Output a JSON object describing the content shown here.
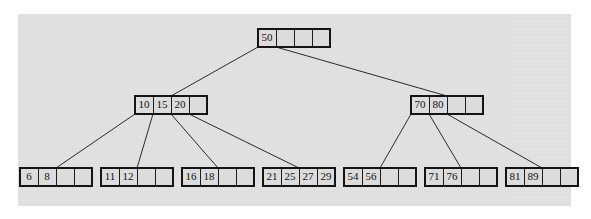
{
  "figure": {
    "background_color": "#ffffff",
    "panel_color": "#e3e3e3",
    "node_fill_color": "#dcdcdc",
    "node_border_color": "#1c1c1c",
    "edge_color": "#2a2a2a",
    "text_color": "#111111"
  },
  "ghost": {
    "top": "",
    "middle": "",
    "bottom": ""
  },
  "chart_data": {
    "type": "diagram",
    "diagram_kind": "b-tree",
    "node_capacity": 4,
    "levels": 3,
    "nodes": [
      {
        "id": "root",
        "level": 0,
        "keys": [
          "50"
        ],
        "empty_slots": 3,
        "x": 258,
        "y": 29,
        "cells": [
          "50",
          "",
          "",
          ""
        ]
      },
      {
        "id": "internal-left",
        "level": 1,
        "keys": [
          "10",
          "15",
          "20"
        ],
        "empty_slots": 1,
        "x": 135,
        "y": 96,
        "cells": [
          "10",
          "15",
          "20",
          ""
        ]
      },
      {
        "id": "internal-right",
        "level": 1,
        "keys": [
          "70",
          "80"
        ],
        "empty_slots": 2,
        "x": 411,
        "y": 96,
        "cells": [
          "70",
          "80",
          "",
          ""
        ]
      },
      {
        "id": "leaf-1",
        "level": 2,
        "keys": [
          "6",
          "8"
        ],
        "empty_slots": 2,
        "x": 20,
        "y": 168,
        "cells": [
          "6",
          "8",
          "",
          ""
        ]
      },
      {
        "id": "leaf-2",
        "level": 2,
        "keys": [
          "11",
          "12"
        ],
        "empty_slots": 2,
        "x": 101,
        "y": 168,
        "cells": [
          "11",
          "12",
          "",
          ""
        ]
      },
      {
        "id": "leaf-3",
        "level": 2,
        "keys": [
          "16",
          "18"
        ],
        "empty_slots": 2,
        "x": 182,
        "y": 168,
        "cells": [
          "16",
          "18",
          "",
          ""
        ]
      },
      {
        "id": "leaf-4",
        "level": 2,
        "keys": [
          "21",
          "25",
          "27",
          "29"
        ],
        "empty_slots": 0,
        "x": 263,
        "y": 168,
        "cells": [
          "21",
          "25",
          "27",
          "29"
        ]
      },
      {
        "id": "leaf-5",
        "level": 2,
        "keys": [
          "54",
          "56"
        ],
        "empty_slots": 2,
        "x": 344,
        "y": 168,
        "cells": [
          "54",
          "56",
          "",
          ""
        ]
      },
      {
        "id": "leaf-6",
        "level": 2,
        "keys": [
          "71",
          "76"
        ],
        "empty_slots": 2,
        "x": 425,
        "y": 168,
        "cells": [
          "71",
          "76",
          "",
          ""
        ]
      },
      {
        "id": "leaf-7",
        "level": 2,
        "keys": [
          "81",
          "89"
        ],
        "empty_slots": 2,
        "x": 506,
        "y": 168,
        "cells": [
          "81",
          "89",
          "",
          ""
        ]
      }
    ],
    "edges": [
      {
        "from": "root",
        "from_slot": 0,
        "to": "internal-left"
      },
      {
        "from": "root",
        "from_slot": 1,
        "to": "internal-right"
      },
      {
        "from": "internal-left",
        "from_slot": 0,
        "to": "leaf-1"
      },
      {
        "from": "internal-left",
        "from_slot": 1,
        "to": "leaf-2"
      },
      {
        "from": "internal-left",
        "from_slot": 2,
        "to": "leaf-3"
      },
      {
        "from": "internal-left",
        "from_slot": 3,
        "to": "leaf-4"
      },
      {
        "from": "internal-right",
        "from_slot": 0,
        "to": "leaf-5"
      },
      {
        "from": "internal-right",
        "from_slot": 1,
        "to": "leaf-6"
      },
      {
        "from": "internal-right",
        "from_slot": 2,
        "to": "leaf-7"
      }
    ],
    "geometry": {
      "cell_width": 18,
      "cell_height": 18,
      "node_width": 72
    }
  }
}
